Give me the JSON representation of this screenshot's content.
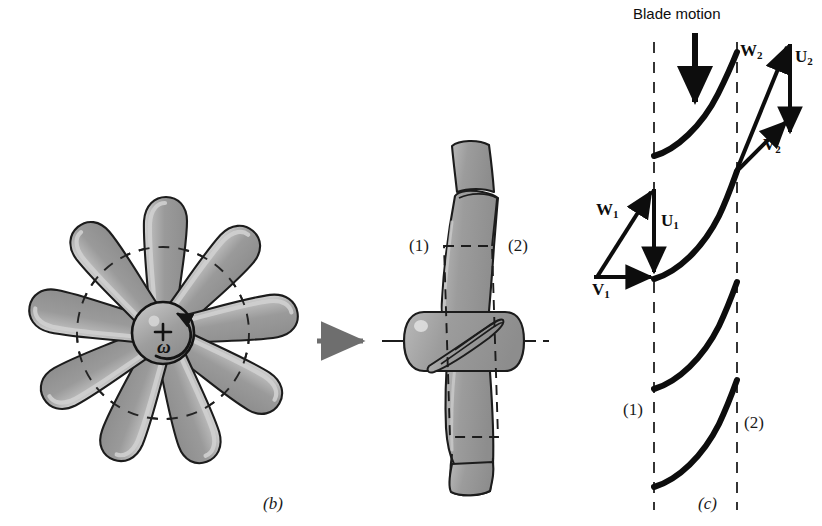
{
  "figure": {
    "title_hidden": "",
    "panels": [
      {
        "id": "b",
        "label": "(b)",
        "description": "axial-flow fan front view with rotation"
      },
      {
        "id": "c",
        "label": "(c)",
        "description": "blade cascade with velocity triangles"
      }
    ]
  },
  "panel_b": {
    "caption": "(b)",
    "hub": {
      "center_marker": "+",
      "rotation_symbol": "ω",
      "rotation_direction": "counterclockwise"
    },
    "blade_count": 9,
    "dashed_circle_label": "mean radius section",
    "transition_arrow": "arrow-right"
  },
  "panel_mid": {
    "station_1_label": "(1)",
    "station_2_label": "(2)",
    "centerline": "dash-dot axis"
  },
  "panel_c": {
    "caption": "(c)",
    "blade_motion_label": "Blade motion",
    "blade_motion_direction": "down",
    "station_1_label": "(1)",
    "station_2_label": "(2)",
    "blade_count_visible": 4,
    "vectors": [
      {
        "name": "W1",
        "symbol": "W",
        "subscript": "1",
        "meaning": "relative velocity inlet",
        "direction": "up-right"
      },
      {
        "name": "U1",
        "symbol": "U",
        "subscript": "1",
        "meaning": "blade speed inlet",
        "direction": "down"
      },
      {
        "name": "V1",
        "symbol": "V",
        "subscript": "1",
        "meaning": "absolute velocity inlet",
        "direction": "right"
      },
      {
        "name": "W2",
        "symbol": "W",
        "subscript": "2",
        "meaning": "relative velocity exit",
        "direction": "up-right-steep"
      },
      {
        "name": "U2",
        "symbol": "U",
        "subscript": "2",
        "meaning": "blade speed exit",
        "direction": "down"
      },
      {
        "name": "V2",
        "symbol": "V",
        "subscript": "2",
        "meaning": "absolute velocity exit",
        "direction": "up-right-shallow"
      }
    ]
  },
  "colors": {
    "blade_fill": "#9a9a9a",
    "blade_highlight": "#c9c9c9",
    "blade_outline": "#1c1c1c",
    "ink": "#0d0d0d",
    "arrow_gray": "#6e6e6e",
    "dashed": "#2b2b2b",
    "background": "#ffffff"
  }
}
